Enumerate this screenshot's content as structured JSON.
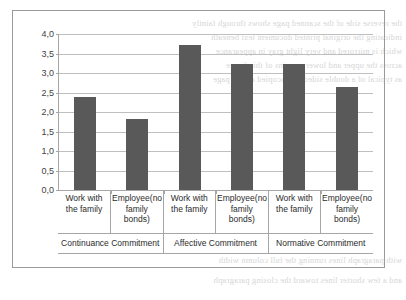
{
  "chart_data": {
    "type": "bar",
    "title": "",
    "subtitle": "",
    "xlabel": "",
    "ylabel": "",
    "ylim": [
      0.0,
      4.0
    ],
    "ytick_labels": [
      "0,0",
      "0,5",
      "1,0",
      "1,5",
      "2,0",
      "2,5",
      "3,0",
      "3,5",
      "4,0"
    ],
    "ytick_values": [
      0.0,
      0.5,
      1.0,
      1.5,
      2.0,
      2.5,
      3.0,
      3.5,
      4.0
    ],
    "grid": true,
    "legend": "none",
    "decimal_separator": ",",
    "categories": [
      "Work with the family",
      "Employee(no family bonds)",
      "Work with the family",
      "Employee(no family bonds)",
      "Work with the family",
      "Employee(no family bonds)"
    ],
    "values": [
      2.38,
      1.83,
      3.72,
      3.23,
      3.23,
      2.63
    ],
    "groups": [
      {
        "label": "Continuance Commitment",
        "span": 2
      },
      {
        "label": "Affective Commitment",
        "span": 2
      },
      {
        "label": "Normative Commitment",
        "span": 2
      }
    ],
    "bars": [
      {
        "category": "Work with the family",
        "group": "Continuance Commitment",
        "value": 2.38
      },
      {
        "category": "Employee(no family bonds)",
        "group": "Continuance Commitment",
        "value": 1.83
      },
      {
        "category": "Work with the family",
        "group": "Affective Commitment",
        "value": 3.72
      },
      {
        "category": "Employee(no family bonds)",
        "group": "Affective Commitment",
        "value": 3.23
      },
      {
        "category": "Work with the family",
        "group": "Normative Commitment",
        "value": 3.23
      },
      {
        "category": "Employee(no family bonds)",
        "group": "Normative Commitment",
        "value": 2.63
      }
    ],
    "colors": {
      "bar": "#595959",
      "gridline": "#bfbfbf",
      "axis": "#a6a6a6",
      "border": "#9a9a9a",
      "text": "#2b2b2b",
      "background": "#ffffff"
    }
  },
  "background_bleed": [
    "the reverse side of the scanned page shows through faintly",
    "indicating the original printed document text beneath",
    "which is mirrored and very light gray in appearance",
    "across the upper and lower margins of this figure",
    "as typical of a double sided photocopied article page",
    "with paragraph lines running the full column width",
    "and a few shorter lines toward the closing paragraph"
  ]
}
